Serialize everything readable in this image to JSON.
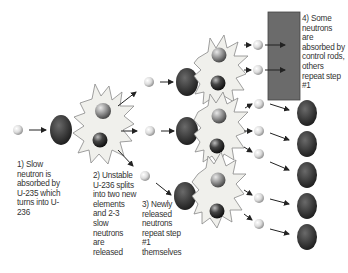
{
  "colors": {
    "nucleus": "#3a3a3a",
    "neutron": "#e4e4e4",
    "fragment_light": "#8a8a8a",
    "fragment_dark": "#2e2e2e",
    "star_fill": "#f0f0ec",
    "star_stroke": "#888888",
    "control_rod": "#6b6b6b",
    "arrow": "#222222",
    "text": "#333333"
  },
  "steps": [
    {
      "id": 1,
      "lines": [
        "1) Slow",
        "neutron is",
        "absorbed by",
        "U-235 which",
        "turns into U-",
        "236"
      ]
    },
    {
      "id": 2,
      "lines": [
        "2) Unstable",
        "U-236 splits",
        "into two new",
        "elements",
        "and 2-3",
        "slow",
        "neutrons",
        "are",
        "released"
      ]
    },
    {
      "id": 3,
      "lines": [
        "3) Newly",
        "released",
        "neutrons",
        "repeat step",
        "#1",
        "themselves"
      ]
    },
    {
      "id": 4,
      "lines": [
        "4) Some",
        "neutrons",
        "are",
        "absorbed by",
        "control rods,",
        "others",
        "repeat step",
        "#1"
      ]
    }
  ],
  "elements": {
    "control_rod": "control rod",
    "nucleus": "U-235 nucleus",
    "neutron": "slow neutron",
    "fission_burst": "U-236 fission"
  }
}
